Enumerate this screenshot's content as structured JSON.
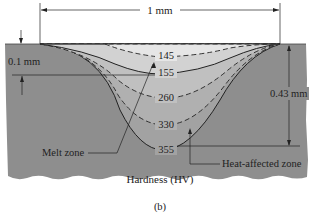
{
  "figure": {
    "caption": "(b)",
    "title": "Hardness (HV)"
  },
  "dimensions": {
    "width_label": "1 mm",
    "melt_depth_label": "0.1 mm",
    "total_depth_label": "0.43 mm"
  },
  "zones": {
    "melt_zone_label": "Melt zone",
    "haz_label": "Heat-affected zone"
  },
  "contours": [
    {
      "value": "145",
      "style": "dashed"
    },
    {
      "value": "155",
      "style": "solid"
    },
    {
      "value": "260",
      "style": "dashed"
    },
    {
      "value": "330",
      "style": "dashed"
    },
    {
      "value": "355",
      "style": "solid"
    }
  ],
  "colors": {
    "substrate": "#8e8e8e",
    "zone_1": "#e6e6e6",
    "zone_2": "#d2d2d2",
    "zone_3": "#c0c0c0",
    "zone_4": "#b0b0b0",
    "zone_5": "#a2a2a2",
    "line": "#222222"
  }
}
